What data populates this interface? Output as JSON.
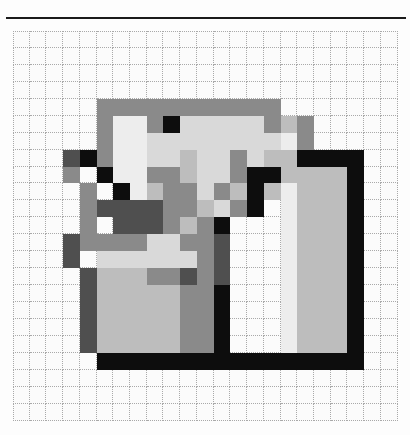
{
  "page": {
    "background_color": "#fdfdfd",
    "divider": {
      "name": "top-rule",
      "color": "#1b1b1b"
    }
  },
  "grid": {
    "columns": 23,
    "rows": 23,
    "cell_size_px": 17,
    "line_color": "#a9a9a9",
    "line_style": "dotted",
    "background_color": "#fbfbfb"
  },
  "palette": {
    "empty": "#fbfbfb",
    "black": "#0d0d0d",
    "dark_gray": "#4f4f4f",
    "mid_gray": "#8a8a8a",
    "light_gray": "#bdbdbd",
    "pale_gray": "#d9d9d9",
    "near_white": "#ededed"
  },
  "chart_data": {
    "type": "heatmap",
    "title": "",
    "xlabel": "",
    "ylabel": "",
    "grid_width": 23,
    "grid_height": 23,
    "legend": [
      {
        "key": ".",
        "label": "empty",
        "color": "#fbfbfb"
      },
      {
        "key": "K",
        "label": "black",
        "color": "#0d0d0d"
      },
      {
        "key": "D",
        "label": "dark gray",
        "color": "#4f4f4f"
      },
      {
        "key": "M",
        "label": "mid gray",
        "color": "#8a8a8a"
      },
      {
        "key": "L",
        "label": "light gray",
        "color": "#bdbdbd"
      },
      {
        "key": "P",
        "label": "pale gray",
        "color": "#d9d9d9"
      },
      {
        "key": "W",
        "label": "near white",
        "color": "#ededed"
      }
    ],
    "rows": [
      ".......................",
      ".......................",
      ".......................",
      ".......................",
      ".....MMMMMMMMMMM.......",
      ".....MLLLMKPPPPPM M....",
      ".....MPPPPPPPPPPM.M....",
      "...DK M PPMMPPM M.MKKKK",
      "...DM K PPDMPM MKK LLLK",
      "....M K LLMMPM K W LLLK",
      "....MDDDDMMLPMK. W LLLK",
      "....M DDDMLMK.. W LLLK.",
      "...DMMMMPPMMD.. W LLLK.",
      "...D PPPPPPMD.. W LLLK.",
      "....DLLLMMDMD.. W LLLK.",
      "....D LLLLLMK.. W LLLK.",
      "....D LLLLLMK.. W LLLK.",
      "....D LLLLLMK.. W LLLK.",
      "....D LLLLLMK.. W LLLK.",
      ".....KKKKKKKKKKKKKKKKK.",
      ".......................",
      ".......................",
      "......................."
    ],
    "pixels": [
      {
        "x": 5,
        "y": 4,
        "c": "#8a8a8a"
      },
      {
        "x": 6,
        "y": 4,
        "c": "#8a8a8a"
      },
      {
        "x": 7,
        "y": 4,
        "c": "#8a8a8a"
      },
      {
        "x": 8,
        "y": 4,
        "c": "#8a8a8a"
      },
      {
        "x": 9,
        "y": 4,
        "c": "#8a8a8a"
      },
      {
        "x": 10,
        "y": 4,
        "c": "#8a8a8a"
      },
      {
        "x": 11,
        "y": 4,
        "c": "#8a8a8a"
      },
      {
        "x": 12,
        "y": 4,
        "c": "#8a8a8a"
      },
      {
        "x": 13,
        "y": 4,
        "c": "#8a8a8a"
      },
      {
        "x": 14,
        "y": 4,
        "c": "#8a8a8a"
      },
      {
        "x": 15,
        "y": 4,
        "c": "#8a8a8a"
      },
      {
        "x": 5,
        "y": 5,
        "c": "#8a8a8a"
      },
      {
        "x": 6,
        "y": 5,
        "c": "#ededed"
      },
      {
        "x": 7,
        "y": 5,
        "c": "#ededed"
      },
      {
        "x": 8,
        "y": 5,
        "c": "#8a8a8a"
      },
      {
        "x": 9,
        "y": 5,
        "c": "#0d0d0d"
      },
      {
        "x": 10,
        "y": 5,
        "c": "#d9d9d9"
      },
      {
        "x": 11,
        "y": 5,
        "c": "#d9d9d9"
      },
      {
        "x": 12,
        "y": 5,
        "c": "#d9d9d9"
      },
      {
        "x": 13,
        "y": 5,
        "c": "#d9d9d9"
      },
      {
        "x": 14,
        "y": 5,
        "c": "#d9d9d9"
      },
      {
        "x": 15,
        "y": 5,
        "c": "#8a8a8a"
      },
      {
        "x": 16,
        "y": 5,
        "c": "#bdbdbd"
      },
      {
        "x": 17,
        "y": 5,
        "c": "#8a8a8a"
      },
      {
        "x": 5,
        "y": 6,
        "c": "#8a8a8a"
      },
      {
        "x": 6,
        "y": 6,
        "c": "#ededed"
      },
      {
        "x": 7,
        "y": 6,
        "c": "#ededed"
      },
      {
        "x": 8,
        "y": 6,
        "c": "#d9d9d9"
      },
      {
        "x": 9,
        "y": 6,
        "c": "#d9d9d9"
      },
      {
        "x": 10,
        "y": 6,
        "c": "#d9d9d9"
      },
      {
        "x": 11,
        "y": 6,
        "c": "#d9d9d9"
      },
      {
        "x": 12,
        "y": 6,
        "c": "#d9d9d9"
      },
      {
        "x": 13,
        "y": 6,
        "c": "#d9d9d9"
      },
      {
        "x": 14,
        "y": 6,
        "c": "#d9d9d9"
      },
      {
        "x": 15,
        "y": 6,
        "c": "#d9d9d9"
      },
      {
        "x": 16,
        "y": 6,
        "c": "#ededed"
      },
      {
        "x": 17,
        "y": 6,
        "c": "#8a8a8a"
      },
      {
        "x": 3,
        "y": 7,
        "c": "#4f4f4f"
      },
      {
        "x": 4,
        "y": 7,
        "c": "#0d0d0d"
      },
      {
        "x": 5,
        "y": 7,
        "c": "#8a8a8a"
      },
      {
        "x": 6,
        "y": 7,
        "c": "#ededed"
      },
      {
        "x": 7,
        "y": 7,
        "c": "#ededed"
      },
      {
        "x": 8,
        "y": 7,
        "c": "#d9d9d9"
      },
      {
        "x": 9,
        "y": 7,
        "c": "#d9d9d9"
      },
      {
        "x": 10,
        "y": 7,
        "c": "#bdbdbd"
      },
      {
        "x": 11,
        "y": 7,
        "c": "#d9d9d9"
      },
      {
        "x": 12,
        "y": 7,
        "c": "#d9d9d9"
      },
      {
        "x": 13,
        "y": 7,
        "c": "#8a8a8a"
      },
      {
        "x": 14,
        "y": 7,
        "c": "#d9d9d9"
      },
      {
        "x": 15,
        "y": 7,
        "c": "#bdbdbd"
      },
      {
        "x": 16,
        "y": 7,
        "c": "#bdbdbd"
      },
      {
        "x": 17,
        "y": 7,
        "c": "#0d0d0d"
      },
      {
        "x": 18,
        "y": 7,
        "c": "#0d0d0d"
      },
      {
        "x": 19,
        "y": 7,
        "c": "#0d0d0d"
      },
      {
        "x": 20,
        "y": 7,
        "c": "#0d0d0d"
      },
      {
        "x": 3,
        "y": 8,
        "c": "#8a8a8a"
      },
      {
        "x": 5,
        "y": 8,
        "c": "#0d0d0d"
      },
      {
        "x": 6,
        "y": 8,
        "c": "#ededed"
      },
      {
        "x": 7,
        "y": 8,
        "c": "#ededed"
      },
      {
        "x": 8,
        "y": 8,
        "c": "#8a8a8a"
      },
      {
        "x": 9,
        "y": 8,
        "c": "#8a8a8a"
      },
      {
        "x": 10,
        "y": 8,
        "c": "#bdbdbd"
      },
      {
        "x": 11,
        "y": 8,
        "c": "#d9d9d9"
      },
      {
        "x": 12,
        "y": 8,
        "c": "#d9d9d9"
      },
      {
        "x": 13,
        "y": 8,
        "c": "#8a8a8a"
      },
      {
        "x": 14,
        "y": 8,
        "c": "#0d0d0d"
      },
      {
        "x": 15,
        "y": 8,
        "c": "#0d0d0d"
      },
      {
        "x": 16,
        "y": 8,
        "c": "#bdbdbd"
      },
      {
        "x": 17,
        "y": 8,
        "c": "#bdbdbd"
      },
      {
        "x": 18,
        "y": 8,
        "c": "#bdbdbd"
      },
      {
        "x": 19,
        "y": 8,
        "c": "#bdbdbd"
      },
      {
        "x": 20,
        "y": 8,
        "c": "#0d0d0d"
      },
      {
        "x": 4,
        "y": 9,
        "c": "#8a8a8a"
      },
      {
        "x": 6,
        "y": 9,
        "c": "#0d0d0d"
      },
      {
        "x": 7,
        "y": 9,
        "c": "#ededed"
      },
      {
        "x": 8,
        "y": 9,
        "c": "#bdbdbd"
      },
      {
        "x": 9,
        "y": 9,
        "c": "#8a8a8a"
      },
      {
        "x": 10,
        "y": 9,
        "c": "#8a8a8a"
      },
      {
        "x": 11,
        "y": 9,
        "c": "#d9d9d9"
      },
      {
        "x": 12,
        "y": 9,
        "c": "#8a8a8a"
      },
      {
        "x": 13,
        "y": 9,
        "c": "#bdbdbd"
      },
      {
        "x": 14,
        "y": 9,
        "c": "#0d0d0d"
      },
      {
        "x": 15,
        "y": 9,
        "c": "#bdbdbd"
      },
      {
        "x": 16,
        "y": 9,
        "c": "#ededed"
      },
      {
        "x": 17,
        "y": 9,
        "c": "#bdbdbd"
      },
      {
        "x": 18,
        "y": 9,
        "c": "#bdbdbd"
      },
      {
        "x": 19,
        "y": 9,
        "c": "#bdbdbd"
      },
      {
        "x": 20,
        "y": 9,
        "c": "#0d0d0d"
      },
      {
        "x": 4,
        "y": 10,
        "c": "#8a8a8a"
      },
      {
        "x": 5,
        "y": 10,
        "c": "#4f4f4f"
      },
      {
        "x": 6,
        "y": 10,
        "c": "#4f4f4f"
      },
      {
        "x": 7,
        "y": 10,
        "c": "#4f4f4f"
      },
      {
        "x": 8,
        "y": 10,
        "c": "#4f4f4f"
      },
      {
        "x": 9,
        "y": 10,
        "c": "#8a8a8a"
      },
      {
        "x": 10,
        "y": 10,
        "c": "#8a8a8a"
      },
      {
        "x": 11,
        "y": 10,
        "c": "#bdbdbd"
      },
      {
        "x": 12,
        "y": 10,
        "c": "#d9d9d9"
      },
      {
        "x": 13,
        "y": 10,
        "c": "#8a8a8a"
      },
      {
        "x": 14,
        "y": 10,
        "c": "#0d0d0d"
      },
      {
        "x": 16,
        "y": 10,
        "c": "#ededed"
      },
      {
        "x": 17,
        "y": 10,
        "c": "#bdbdbd"
      },
      {
        "x": 18,
        "y": 10,
        "c": "#bdbdbd"
      },
      {
        "x": 19,
        "y": 10,
        "c": "#bdbdbd"
      },
      {
        "x": 20,
        "y": 10,
        "c": "#0d0d0d"
      },
      {
        "x": 4,
        "y": 11,
        "c": "#8a8a8a"
      },
      {
        "x": 6,
        "y": 11,
        "c": "#4f4f4f"
      },
      {
        "x": 7,
        "y": 11,
        "c": "#4f4f4f"
      },
      {
        "x": 8,
        "y": 11,
        "c": "#4f4f4f"
      },
      {
        "x": 9,
        "y": 11,
        "c": "#8a8a8a"
      },
      {
        "x": 10,
        "y": 11,
        "c": "#bdbdbd"
      },
      {
        "x": 11,
        "y": 11,
        "c": "#8a8a8a"
      },
      {
        "x": 12,
        "y": 11,
        "c": "#0d0d0d"
      },
      {
        "x": 16,
        "y": 11,
        "c": "#ededed"
      },
      {
        "x": 17,
        "y": 11,
        "c": "#bdbdbd"
      },
      {
        "x": 18,
        "y": 11,
        "c": "#bdbdbd"
      },
      {
        "x": 19,
        "y": 11,
        "c": "#bdbdbd"
      },
      {
        "x": 20,
        "y": 11,
        "c": "#0d0d0d"
      },
      {
        "x": 3,
        "y": 12,
        "c": "#4f4f4f"
      },
      {
        "x": 4,
        "y": 12,
        "c": "#8a8a8a"
      },
      {
        "x": 5,
        "y": 12,
        "c": "#8a8a8a"
      },
      {
        "x": 6,
        "y": 12,
        "c": "#8a8a8a"
      },
      {
        "x": 7,
        "y": 12,
        "c": "#8a8a8a"
      },
      {
        "x": 8,
        "y": 12,
        "c": "#d9d9d9"
      },
      {
        "x": 9,
        "y": 12,
        "c": "#d9d9d9"
      },
      {
        "x": 10,
        "y": 12,
        "c": "#8a8a8a"
      },
      {
        "x": 11,
        "y": 12,
        "c": "#8a8a8a"
      },
      {
        "x": 12,
        "y": 12,
        "c": "#4f4f4f"
      },
      {
        "x": 16,
        "y": 12,
        "c": "#ededed"
      },
      {
        "x": 17,
        "y": 12,
        "c": "#bdbdbd"
      },
      {
        "x": 18,
        "y": 12,
        "c": "#bdbdbd"
      },
      {
        "x": 19,
        "y": 12,
        "c": "#bdbdbd"
      },
      {
        "x": 20,
        "y": 12,
        "c": "#0d0d0d"
      },
      {
        "x": 3,
        "y": 13,
        "c": "#4f4f4f"
      },
      {
        "x": 5,
        "y": 13,
        "c": "#d9d9d9"
      },
      {
        "x": 6,
        "y": 13,
        "c": "#d9d9d9"
      },
      {
        "x": 7,
        "y": 13,
        "c": "#d9d9d9"
      },
      {
        "x": 8,
        "y": 13,
        "c": "#d9d9d9"
      },
      {
        "x": 9,
        "y": 13,
        "c": "#d9d9d9"
      },
      {
        "x": 10,
        "y": 13,
        "c": "#d9d9d9"
      },
      {
        "x": 11,
        "y": 13,
        "c": "#8a8a8a"
      },
      {
        "x": 12,
        "y": 13,
        "c": "#4f4f4f"
      },
      {
        "x": 16,
        "y": 13,
        "c": "#ededed"
      },
      {
        "x": 17,
        "y": 13,
        "c": "#bdbdbd"
      },
      {
        "x": 18,
        "y": 13,
        "c": "#bdbdbd"
      },
      {
        "x": 19,
        "y": 13,
        "c": "#bdbdbd"
      },
      {
        "x": 20,
        "y": 13,
        "c": "#0d0d0d"
      },
      {
        "x": 4,
        "y": 14,
        "c": "#4f4f4f"
      },
      {
        "x": 5,
        "y": 14,
        "c": "#bdbdbd"
      },
      {
        "x": 6,
        "y": 14,
        "c": "#bdbdbd"
      },
      {
        "x": 7,
        "y": 14,
        "c": "#bdbdbd"
      },
      {
        "x": 8,
        "y": 14,
        "c": "#8a8a8a"
      },
      {
        "x": 9,
        "y": 14,
        "c": "#8a8a8a"
      },
      {
        "x": 10,
        "y": 14,
        "c": "#4f4f4f"
      },
      {
        "x": 11,
        "y": 14,
        "c": "#8a8a8a"
      },
      {
        "x": 12,
        "y": 14,
        "c": "#4f4f4f"
      },
      {
        "x": 16,
        "y": 14,
        "c": "#ededed"
      },
      {
        "x": 17,
        "y": 14,
        "c": "#bdbdbd"
      },
      {
        "x": 18,
        "y": 14,
        "c": "#bdbdbd"
      },
      {
        "x": 19,
        "y": 14,
        "c": "#bdbdbd"
      },
      {
        "x": 20,
        "y": 14,
        "c": "#0d0d0d"
      },
      {
        "x": 4,
        "y": 15,
        "c": "#4f4f4f"
      },
      {
        "x": 5,
        "y": 15,
        "c": "#bdbdbd"
      },
      {
        "x": 6,
        "y": 15,
        "c": "#bdbdbd"
      },
      {
        "x": 7,
        "y": 15,
        "c": "#bdbdbd"
      },
      {
        "x": 8,
        "y": 15,
        "c": "#bdbdbd"
      },
      {
        "x": 9,
        "y": 15,
        "c": "#bdbdbd"
      },
      {
        "x": 10,
        "y": 15,
        "c": "#8a8a8a"
      },
      {
        "x": 11,
        "y": 15,
        "c": "#8a8a8a"
      },
      {
        "x": 12,
        "y": 15,
        "c": "#0d0d0d"
      },
      {
        "x": 16,
        "y": 15,
        "c": "#ededed"
      },
      {
        "x": 17,
        "y": 15,
        "c": "#bdbdbd"
      },
      {
        "x": 18,
        "y": 15,
        "c": "#bdbdbd"
      },
      {
        "x": 19,
        "y": 15,
        "c": "#bdbdbd"
      },
      {
        "x": 20,
        "y": 15,
        "c": "#0d0d0d"
      },
      {
        "x": 4,
        "y": 16,
        "c": "#4f4f4f"
      },
      {
        "x": 5,
        "y": 16,
        "c": "#bdbdbd"
      },
      {
        "x": 6,
        "y": 16,
        "c": "#bdbdbd"
      },
      {
        "x": 7,
        "y": 16,
        "c": "#bdbdbd"
      },
      {
        "x": 8,
        "y": 16,
        "c": "#bdbdbd"
      },
      {
        "x": 9,
        "y": 16,
        "c": "#bdbdbd"
      },
      {
        "x": 10,
        "y": 16,
        "c": "#8a8a8a"
      },
      {
        "x": 11,
        "y": 16,
        "c": "#8a8a8a"
      },
      {
        "x": 12,
        "y": 16,
        "c": "#0d0d0d"
      },
      {
        "x": 16,
        "y": 16,
        "c": "#ededed"
      },
      {
        "x": 17,
        "y": 16,
        "c": "#bdbdbd"
      },
      {
        "x": 18,
        "y": 16,
        "c": "#bdbdbd"
      },
      {
        "x": 19,
        "y": 16,
        "c": "#bdbdbd"
      },
      {
        "x": 20,
        "y": 16,
        "c": "#0d0d0d"
      },
      {
        "x": 4,
        "y": 17,
        "c": "#4f4f4f"
      },
      {
        "x": 5,
        "y": 17,
        "c": "#bdbdbd"
      },
      {
        "x": 6,
        "y": 17,
        "c": "#bdbdbd"
      },
      {
        "x": 7,
        "y": 17,
        "c": "#bdbdbd"
      },
      {
        "x": 8,
        "y": 17,
        "c": "#bdbdbd"
      },
      {
        "x": 9,
        "y": 17,
        "c": "#bdbdbd"
      },
      {
        "x": 10,
        "y": 17,
        "c": "#8a8a8a"
      },
      {
        "x": 11,
        "y": 17,
        "c": "#8a8a8a"
      },
      {
        "x": 12,
        "y": 17,
        "c": "#0d0d0d"
      },
      {
        "x": 16,
        "y": 17,
        "c": "#ededed"
      },
      {
        "x": 17,
        "y": 17,
        "c": "#bdbdbd"
      },
      {
        "x": 18,
        "y": 17,
        "c": "#bdbdbd"
      },
      {
        "x": 19,
        "y": 17,
        "c": "#bdbdbd"
      },
      {
        "x": 20,
        "y": 17,
        "c": "#0d0d0d"
      },
      {
        "x": 4,
        "y": 18,
        "c": "#4f4f4f"
      },
      {
        "x": 5,
        "y": 18,
        "c": "#bdbdbd"
      },
      {
        "x": 6,
        "y": 18,
        "c": "#bdbdbd"
      },
      {
        "x": 7,
        "y": 18,
        "c": "#bdbdbd"
      },
      {
        "x": 8,
        "y": 18,
        "c": "#bdbdbd"
      },
      {
        "x": 9,
        "y": 18,
        "c": "#bdbdbd"
      },
      {
        "x": 10,
        "y": 18,
        "c": "#8a8a8a"
      },
      {
        "x": 11,
        "y": 18,
        "c": "#8a8a8a"
      },
      {
        "x": 12,
        "y": 18,
        "c": "#0d0d0d"
      },
      {
        "x": 16,
        "y": 18,
        "c": "#ededed"
      },
      {
        "x": 17,
        "y": 18,
        "c": "#bdbdbd"
      },
      {
        "x": 18,
        "y": 18,
        "c": "#bdbdbd"
      },
      {
        "x": 19,
        "y": 18,
        "c": "#bdbdbd"
      },
      {
        "x": 20,
        "y": 18,
        "c": "#0d0d0d"
      },
      {
        "x": 5,
        "y": 19,
        "c": "#0d0d0d"
      },
      {
        "x": 6,
        "y": 19,
        "c": "#0d0d0d"
      },
      {
        "x": 7,
        "y": 19,
        "c": "#0d0d0d"
      },
      {
        "x": 8,
        "y": 19,
        "c": "#0d0d0d"
      },
      {
        "x": 9,
        "y": 19,
        "c": "#0d0d0d"
      },
      {
        "x": 10,
        "y": 19,
        "c": "#0d0d0d"
      },
      {
        "x": 11,
        "y": 19,
        "c": "#0d0d0d"
      },
      {
        "x": 12,
        "y": 19,
        "c": "#0d0d0d"
      },
      {
        "x": 13,
        "y": 19,
        "c": "#0d0d0d"
      },
      {
        "x": 14,
        "y": 19,
        "c": "#0d0d0d"
      },
      {
        "x": 15,
        "y": 19,
        "c": "#0d0d0d"
      },
      {
        "x": 16,
        "y": 19,
        "c": "#0d0d0d"
      },
      {
        "x": 17,
        "y": 19,
        "c": "#0d0d0d"
      },
      {
        "x": 18,
        "y": 19,
        "c": "#0d0d0d"
      },
      {
        "x": 19,
        "y": 19,
        "c": "#0d0d0d"
      },
      {
        "x": 20,
        "y": 19,
        "c": "#0d0d0d"
      }
    ]
  }
}
